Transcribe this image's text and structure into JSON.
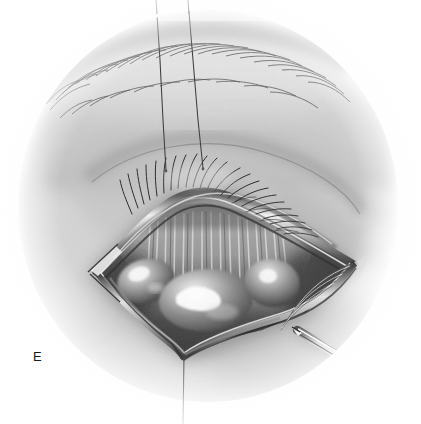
{
  "figure": {
    "label": "E",
    "medium": "pencil and airbrush halftone",
    "palette": {
      "paper": "#ffffff",
      "skin_light": "#e9e9e9",
      "skin_mid": "#c9c9c9",
      "skin_shadow": "#9a9a9a",
      "wound_deep": "#4a4a4a",
      "wound_dark": "#2e2e2e",
      "tarsus": "#8e8e8e",
      "highlight": "#fafafa",
      "suture": "#3a3a3a",
      "instrument": "#7d7d7d",
      "ink": "#1a1a1a"
    }
  },
  "anatomy": {
    "parts": [
      {
        "name": "eyebrow",
        "label": "Eyebrow",
        "region": "upper left arc"
      },
      {
        "name": "brow-fat-pad",
        "label": "Brow fat pad",
        "region": "upper center"
      },
      {
        "name": "eyelashes",
        "label": "Eyelashes",
        "region": "everted lid margin"
      },
      {
        "name": "upper-lid-margin",
        "label": "Upper eyelid margin",
        "region": "above wound"
      },
      {
        "name": "wound-cavity",
        "label": "Surgical wound cavity",
        "region": "center diamond"
      },
      {
        "name": "tarsal-plate",
        "label": "Tarsal plate striations",
        "region": "upper wound bed"
      },
      {
        "name": "fat-pad-medial",
        "label": "Medial fat pad",
        "region": "lower left of wound"
      },
      {
        "name": "fat-pad-central",
        "label": "Central fat pad",
        "region": "lower center of wound"
      },
      {
        "name": "fat-pad-lateral",
        "label": "Lateral fat pad",
        "region": "lower right of wound"
      },
      {
        "name": "lateral-canthus-folds",
        "label": "Lateral canthal folds",
        "region": "right angle"
      },
      {
        "name": "medial-canthus-angle",
        "label": "Medial canthal angle",
        "region": "left angle"
      },
      {
        "name": "lower-wound-edge",
        "label": "Lower wound edge",
        "region": "bottom V apex"
      }
    ]
  },
  "instruments": {
    "items": [
      {
        "name": "forceps",
        "label": "Surgical forceps tip",
        "entry": "lower right",
        "tip_x": 296,
        "tip_y": 330
      }
    ]
  },
  "sutures": {
    "items": [
      {
        "name": "traction-suture-left",
        "label": "Traction suture (left)",
        "x_top": 156,
        "x_bottom": 166
      },
      {
        "name": "traction-suture-right",
        "label": "Traction suture (right)",
        "x_top": 188,
        "x_bottom": 203
      },
      {
        "name": "traction-suture-inferior",
        "label": "Inferior traction suture",
        "x_top": 184,
        "x_bottom": 183
      }
    ],
    "count": 3
  }
}
